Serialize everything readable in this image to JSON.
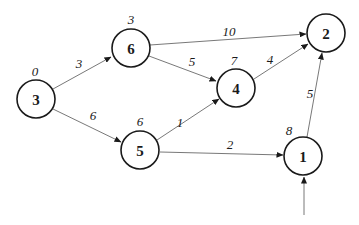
{
  "graph": {
    "nodes": [
      {
        "id": "3",
        "label": "3",
        "distance": "0",
        "x": 36,
        "y": 99
      },
      {
        "id": "6",
        "label": "6",
        "distance": "3",
        "x": 131,
        "y": 48
      },
      {
        "id": "2",
        "label": "2",
        "distance": "",
        "x": 326,
        "y": 33
      },
      {
        "id": "4",
        "label": "4",
        "distance": "7",
        "x": 236,
        "y": 88
      },
      {
        "id": "5",
        "label": "5",
        "distance": "6",
        "x": 140,
        "y": 150
      },
      {
        "id": "1",
        "label": "1",
        "distance": "8",
        "x": 303,
        "y": 156
      }
    ],
    "edges": [
      {
        "from": "3",
        "to": "6",
        "weight": "3"
      },
      {
        "from": "3",
        "to": "5",
        "weight": "6"
      },
      {
        "from": "6",
        "to": "2",
        "weight": "10"
      },
      {
        "from": "6",
        "to": "4",
        "weight": "5"
      },
      {
        "from": "5",
        "to": "4",
        "weight": "1"
      },
      {
        "from": "4",
        "to": "2",
        "weight": "4"
      },
      {
        "from": "5",
        "to": "1",
        "weight": "2"
      },
      {
        "from": "1",
        "to": "2",
        "weight": "5"
      }
    ],
    "start_arrow": {
      "to": "1"
    }
  }
}
